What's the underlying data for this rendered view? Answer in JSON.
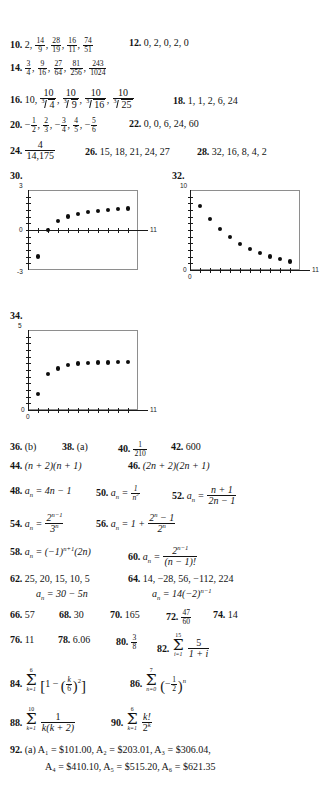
{
  "page": {
    "kind": "textbook-answer-key",
    "background_color": "#ffffff",
    "text_color": "#131313"
  },
  "answers": {
    "a10": {
      "number": "10.",
      "text": "2, 14/9, 28/19, 16/11, 74/51"
    },
    "a12": {
      "number": "12.",
      "text": "0, 2, 0, 2, 0"
    },
    "a14": {
      "number": "14.",
      "text": "3/4, 9/16, 27/64, 81/256, 243/1024"
    },
    "a16": {
      "number": "16.",
      "text": "10, 10/cbrt(4), 10/cbrt(9), 10/cbrt(16), 10/cbrt(25)"
    },
    "a18": {
      "number": "18.",
      "text": "1, 1, 2, 6, 24"
    },
    "a20": {
      "number": "20.",
      "text": "-1/2, 2/3, -3/4, 4/5, -5/6"
    },
    "a22": {
      "number": "22.",
      "text": "0, 0, 6, 24, 60"
    },
    "a24": {
      "number": "24.",
      "text": "4/14,175"
    },
    "a26": {
      "number": "26.",
      "text": "15, 18, 21, 24, 27"
    },
    "a28": {
      "number": "28.",
      "text": "32, 16, 8, 4, 2"
    },
    "a30": {
      "number": "30."
    },
    "a32": {
      "number": "32."
    },
    "a34": {
      "number": "34."
    },
    "a36": {
      "number": "36.",
      "text": "(b)"
    },
    "a38": {
      "number": "38.",
      "text": "(a)"
    },
    "a40": {
      "number": "40.",
      "text": "1/210"
    },
    "a42": {
      "number": "42.",
      "text": "600"
    },
    "a44": {
      "number": "44.",
      "text": "(n + 2)(n + 1)"
    },
    "a46": {
      "number": "46.",
      "text": "(2n + 2)(2n + 1)"
    },
    "a48": {
      "number": "48.",
      "text": "a_n = 4n - 1"
    },
    "a50": {
      "number": "50.",
      "text": "a_n = 1/n^2"
    },
    "a52": {
      "number": "52.",
      "text": "a_n = (n + 1)/(2n - 1)"
    },
    "a54": {
      "number": "54.",
      "text": "a_n = 2^(n-1)/3^n"
    },
    "a56": {
      "number": "56.",
      "text": "a_n = 1 + (2^n - 1)/2^n"
    },
    "a58": {
      "number": "58.",
      "text": "a_n = (-1)^(n+1)(2n)"
    },
    "a60": {
      "number": "60.",
      "text": "a_n = 2^(n-1)/(n - 1)!"
    },
    "a62": {
      "number": "62.",
      "text": "25, 20, 15, 10, 5",
      "text2": "a_n = 30 - 5n"
    },
    "a64": {
      "number": "64.",
      "text": "14, -28, 56, -112, 224",
      "text2": "a_n = 14(-2)^(n-1)"
    },
    "a66": {
      "number": "66.",
      "text": "57"
    },
    "a68": {
      "number": "68.",
      "text": "30"
    },
    "a70": {
      "number": "70.",
      "text": "165"
    },
    "a72": {
      "number": "72.",
      "text": "47/60"
    },
    "a74": {
      "number": "74.",
      "text": "14"
    },
    "a76": {
      "number": "76.",
      "text": "11"
    },
    "a78": {
      "number": "78.",
      "text": "6.06"
    },
    "a80": {
      "number": "80.",
      "text": "3/8"
    },
    "a82": {
      "number": "82.",
      "text": "sum_{i=1}^{15} 5/(1 + i)"
    },
    "a84": {
      "number": "84.",
      "text": "sum_{k=1}^{6} [1 - (k/6)^2]"
    },
    "a86": {
      "number": "86.",
      "text": "sum_{n=0}^{7} (-1/2)^n"
    },
    "a88": {
      "number": "88.",
      "text": "sum_{k=1}^{10} 1/(k(k + 2))"
    },
    "a90": {
      "number": "90.",
      "text": "sum_{k=1}^{6} k!/2^k"
    },
    "a92": {
      "number": "92.",
      "part": "(a)",
      "line1": "A₁ = $101.00, A₂ = $203.01, A₃ = $306.04,",
      "line2": "A₄ = $410.10, A₅ = $515.20, A₆ = $621.35"
    }
  },
  "literals": {
    "two": "2",
    "n14": "14",
    "d9": "9",
    "n28": "28",
    "d19": "19",
    "n16": "16",
    "d11": "11",
    "n74": "74",
    "d51": "51",
    "zero": "0",
    "n3": "3",
    "d4": "4",
    "n9": "9",
    "d16": "16",
    "n27": "27",
    "d64": "64",
    "n81": "81",
    "d256": "256",
    "n243": "243",
    "d1024": "1024",
    "ten": "10",
    "r3": "3",
    "four": "4",
    "nine": "9",
    "sixteen": "16",
    "twentyfive": "25",
    "one": "1",
    "six": "6",
    "twentyfour": "24",
    "n1": "1",
    "d2": "2",
    "n2": "2",
    "d3": "3",
    "nn3": "3",
    "dd4": "4",
    "n4": "4",
    "d5": "5",
    "n5": "5",
    "d6": "6",
    "sixty": "60",
    "fournum": "4",
    "den14175": "14,175",
    "d210": "210",
    "n47": "47",
    "d60": "60",
    "n3b": "3",
    "d8": "8",
    "five": "5",
    "sumtop15": "15",
    "sumbot_i1": "i=1",
    "sumtop6": "6",
    "sumbot_k1": "k=1",
    "sumtop7": "7",
    "sumbot_n0": "n=0",
    "sumtop10": "10",
    "kfact": "k!",
    "twok": "2",
    "khalf": "k",
    "sixhalf": "6"
  },
  "chart_data": [
    {
      "id": "plot-30",
      "label": "30.",
      "type": "scatter",
      "title": "",
      "xlabel": "",
      "ylabel": "",
      "xlim": [
        0,
        11
      ],
      "ylim": [
        -3,
        3
      ],
      "x_ticklabels": [
        "11"
      ],
      "y_ticklabels": [
        "3",
        "0",
        "-3"
      ],
      "grid": false,
      "legend": null,
      "x": [
        1,
        2,
        3,
        4,
        5,
        6,
        7,
        8,
        9,
        10
      ],
      "y": [
        -2.0,
        0.0,
        0.67,
        1.0,
        1.2,
        1.33,
        1.43,
        1.5,
        1.56,
        1.6
      ]
    },
    {
      "id": "plot-32",
      "label": "32.",
      "type": "scatter",
      "title": "",
      "xlabel": "",
      "ylabel": "",
      "xlim": [
        0,
        11
      ],
      "ylim": [
        0,
        10
      ],
      "x_ticklabels": [
        "0",
        "11"
      ],
      "y_ticklabels": [
        "10",
        "0"
      ],
      "grid": false,
      "legend": null,
      "x": [
        1,
        2,
        3,
        4,
        5,
        6,
        7,
        8,
        9,
        10
      ],
      "y": [
        8.0,
        6.4,
        5.12,
        4.1,
        3.28,
        2.62,
        2.1,
        1.68,
        1.34,
        1.07
      ]
    },
    {
      "id": "plot-34",
      "label": "34.",
      "type": "scatter",
      "title": "",
      "xlabel": "",
      "ylabel": "",
      "xlim": [
        0,
        11
      ],
      "ylim": [
        0,
        5
      ],
      "x_ticklabels": [
        "0",
        "11"
      ],
      "y_ticklabels": [
        "5",
        "0"
      ],
      "grid": false,
      "legend": null,
      "x": [
        1,
        2,
        3,
        4,
        5,
        6,
        7,
        8,
        9,
        10
      ],
      "y": [
        1.0,
        2.25,
        2.6,
        2.8,
        2.9,
        2.95,
        2.97,
        2.98,
        2.99,
        3.0
      ]
    }
  ]
}
